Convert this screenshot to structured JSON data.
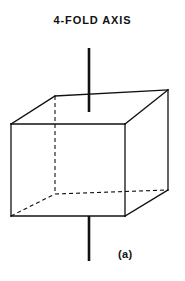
{
  "figure": {
    "title": "4-FOLD AXIS",
    "panel_label": "(a)",
    "background_color": "#ffffff",
    "ink_color": "#111111"
  },
  "geometry": {
    "projection": "oblique",
    "canvas": {
      "width": 185,
      "height": 281
    },
    "vertices": {
      "front_top_left": [
        11,
        124
      ],
      "front_top_right": [
        125,
        124
      ],
      "front_bottom_left": [
        11,
        216
      ],
      "front_bottom_right": [
        125,
        216
      ],
      "back_top_left": [
        55,
        96
      ],
      "back_top_right": [
        168,
        90
      ],
      "back_bottom_left": [
        55,
        194
      ],
      "back_bottom_right": [
        168,
        190
      ]
    },
    "solid_edges": [
      {
        "name": "front-top",
        "from": "front_top_left",
        "to": "front_top_right"
      },
      {
        "name": "front-left",
        "from": "front_top_left",
        "to": "front_bottom_left"
      },
      {
        "name": "front-right",
        "from": "front_top_right",
        "to": "front_bottom_right"
      },
      {
        "name": "front-bottom",
        "from": "front_bottom_left",
        "to": "front_bottom_right"
      },
      {
        "name": "top-back",
        "from": "back_top_left",
        "to": "back_top_right"
      },
      {
        "name": "top-left-diagonal",
        "from": "front_top_left",
        "to": "back_top_left"
      },
      {
        "name": "top-right-diagonal",
        "from": "front_top_right",
        "to": "back_top_right"
      },
      {
        "name": "back-right-vertical",
        "from": "back_top_right",
        "to": "back_bottom_right"
      },
      {
        "name": "bottom-right-diagonal",
        "from": "front_bottom_right",
        "to": "back_bottom_right"
      }
    ],
    "hidden_edges": [
      {
        "name": "back-left-vertical",
        "from": "back_top_left",
        "to": "back_bottom_left"
      },
      {
        "name": "bottom-left-diagonal",
        "from": "front_bottom_left",
        "to": "back_bottom_left"
      },
      {
        "name": "bottom-back",
        "from": "back_bottom_left",
        "to": "back_bottom_right"
      }
    ],
    "axis": {
      "x": 89,
      "top_segment": [
        48,
        112
      ],
      "bottom_segment": [
        216,
        261
      ],
      "stroke_width": 2.6
    },
    "edge_stroke_width": 1.3,
    "hidden_dash_pattern": "4,3"
  }
}
